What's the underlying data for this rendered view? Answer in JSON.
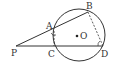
{
  "figure": {
    "stroke_color": "#333333",
    "background": "#ffffff",
    "circle": {
      "center_label": "O",
      "cx": 79,
      "cy": 35,
      "r": 26
    },
    "points": {
      "P": {
        "label": "P",
        "x": 16,
        "y": 46
      },
      "A": {
        "label": "A",
        "x": 54,
        "y": 31
      },
      "B": {
        "label": "B",
        "x": 88,
        "y": 12
      },
      "C": {
        "label": "C",
        "x": 54,
        "y": 46
      },
      "D": {
        "label": "D",
        "x": 103,
        "y": 46
      },
      "O": {
        "label": "O",
        "x": 77,
        "y": 36
      }
    },
    "segments": [
      {
        "from": "P",
        "to": "B",
        "style": "solid"
      },
      {
        "from": "P",
        "to": "D",
        "style": "solid"
      },
      {
        "from": "B",
        "to": "D",
        "style": "dashed"
      },
      {
        "from": "A",
        "to": "C",
        "style": "dashed"
      }
    ],
    "angle_marks": [
      "A",
      "D"
    ]
  }
}
